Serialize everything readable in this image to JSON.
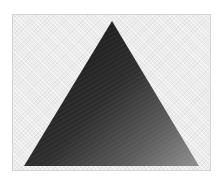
{
  "image": {
    "subject": "dark triangle on light patterned background",
    "background_color": "#ececec",
    "frame_border_color": "#d4d4d4",
    "triangle": {
      "apex": [
        112,
        21
      ],
      "base_left": [
        24,
        166
      ],
      "base_right": [
        199,
        166
      ],
      "gradient_colors": [
        "#1e1e1e",
        "#3a3a3a",
        "#6e6e6e",
        "#8a8a8a"
      ]
    }
  },
  "caption": {
    "text": ""
  }
}
